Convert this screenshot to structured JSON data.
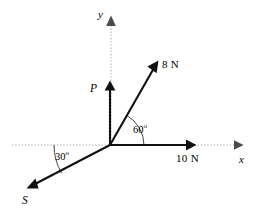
{
  "figure": {
    "background_color": "#ffffff",
    "vector_color": "#111111",
    "axis_color": "#a9a9a9",
    "arc_color": "#333333"
  },
  "axes": {
    "x_label": "x",
    "y_label": "y",
    "origin": {
      "x": 110,
      "y": 145
    },
    "x_range_px": [
      12,
      243
    ],
    "y_top_px": 20
  },
  "vectors": [
    {
      "id": "force-8n",
      "label": "8 N",
      "magnitude": 8,
      "unit": "N",
      "angle_deg": 60,
      "angle_reference": "positive x-axis, counterclockwise",
      "tip_px": {
        "x": 158,
        "y": 62
      },
      "label_px": {
        "x": 162,
        "y": 60
      }
    },
    {
      "id": "force-10n",
      "label": "10 N",
      "magnitude": 10,
      "unit": "N",
      "angle_deg": 0,
      "angle_reference": "positive x-axis",
      "tip_px": {
        "x": 196,
        "y": 145
      },
      "label_px": {
        "x": 176,
        "y": 154
      }
    },
    {
      "id": "force-p",
      "label": "P",
      "magnitude": null,
      "unit": "",
      "angle_deg": 90,
      "angle_reference": "positive x-axis, counterclockwise",
      "tip_px": {
        "x": 110,
        "y": 81
      },
      "label_px": {
        "x": 91,
        "y": 84
      }
    },
    {
      "id": "force-s",
      "label": "S",
      "magnitude": null,
      "unit": "",
      "angle_deg": 210,
      "angle_reference": "positive x-axis, counterclockwise (30 deg below negative x-axis)",
      "tip_px": {
        "x": 27,
        "y": 188
      },
      "label_px": {
        "x": 23,
        "y": 196
      }
    }
  ],
  "angle_marks": [
    {
      "id": "angle-60",
      "value": "60",
      "degree_symbol": "o",
      "between": [
        "force-10n",
        "force-8n"
      ],
      "label_px": {
        "x": 134,
        "y": 124
      },
      "arc_radius_px": 34
    },
    {
      "id": "angle-30",
      "value": "30",
      "degree_symbol": "o",
      "between": [
        "negative-x-axis",
        "force-s"
      ],
      "label_px": {
        "x": 56,
        "y": 151
      },
      "arc_radius_px": 56
    }
  ]
}
